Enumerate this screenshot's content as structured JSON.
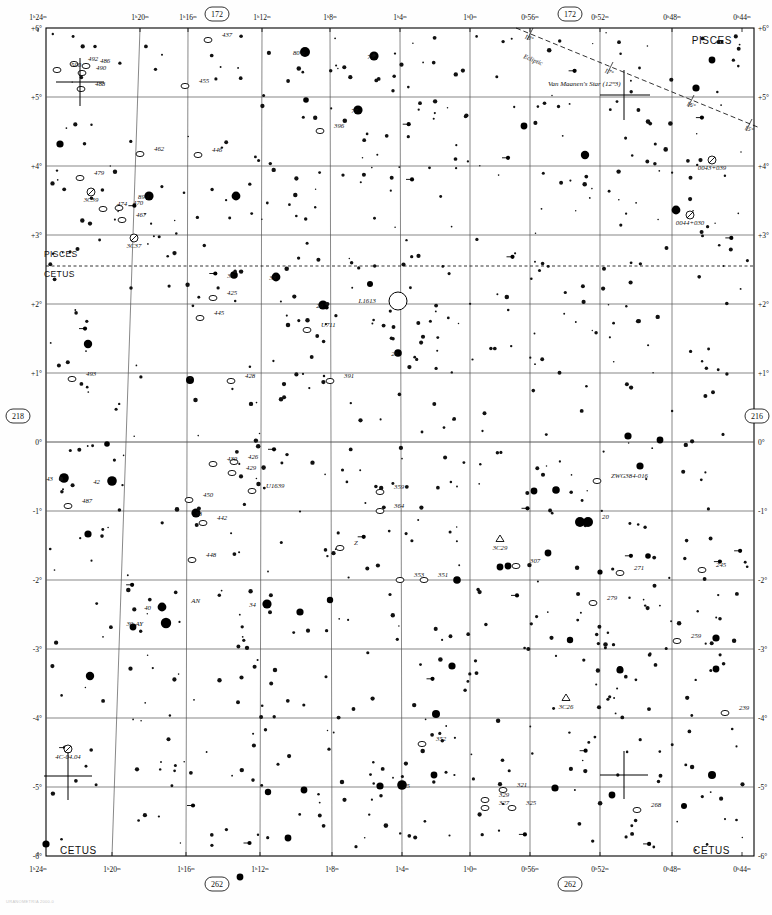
{
  "chart": {
    "number_top": "172",
    "number_top_right": "172",
    "number_bottom": "262",
    "number_bottom_right": "262",
    "number_left": "218",
    "number_right": "216",
    "footer_note": "URANOMETRIA 2000.0"
  },
  "constellations": [
    {
      "name": "PISCES",
      "x": 732,
      "y": 44
    },
    {
      "name": "PISCES",
      "x": 44,
      "y": 257
    },
    {
      "name": "CETUS",
      "x": 44,
      "y": 277
    },
    {
      "name": "CETUS",
      "x": 60,
      "y": 854
    },
    {
      "name": "CETUS",
      "x": 730,
      "y": 854
    }
  ],
  "ra_ticks_top": [
    {
      "label": "1ʰ24ᵐ",
      "x": 38
    },
    {
      "label": "1ʰ20ᵐ",
      "x": 140
    },
    {
      "label": "1ʰ16ᵐ",
      "x": 188
    },
    {
      "label": "1ʰ12ᵐ",
      "x": 262
    },
    {
      "label": "1ʰ8ᵐ",
      "x": 330
    },
    {
      "label": "1ʰ4ᵐ",
      "x": 400
    },
    {
      "label": "1ʰ0ᵐ",
      "x": 470
    },
    {
      "label": "0ʰ56ᵐ",
      "x": 530
    },
    {
      "label": "0ʰ52ᵐ",
      "x": 600
    },
    {
      "label": "0ʰ48ᵐ",
      "x": 672
    },
    {
      "label": "0ʰ44ᵐ",
      "x": 742
    }
  ],
  "ra_ticks_bottom": [
    {
      "label": "1ʰ24ᵐ",
      "x": 38
    },
    {
      "label": "1ʰ20ᵐ",
      "x": 112
    },
    {
      "label": "1ʰ16ᵐ",
      "x": 186
    },
    {
      "label": "1ʰ12ᵐ",
      "x": 260
    },
    {
      "label": "1ʰ8ᵐ",
      "x": 332
    },
    {
      "label": "1ʰ4ᵐ",
      "x": 402
    },
    {
      "label": "1ʰ0ᵐ",
      "x": 470
    },
    {
      "label": "0ʰ56ᵐ",
      "x": 530
    },
    {
      "label": "0ʰ52ᵐ",
      "x": 600
    },
    {
      "label": "0ʰ48ᵐ",
      "x": 672
    },
    {
      "label": "0ʰ44ᵐ",
      "x": 742
    }
  ],
  "dec_ticks": [
    {
      "label": "+6°",
      "y": 28
    },
    {
      "label": "+5°",
      "y": 97
    },
    {
      "label": "+4°",
      "y": 166
    },
    {
      "label": "+3°",
      "y": 235
    },
    {
      "label": "+2°",
      "y": 304
    },
    {
      "label": "+1°",
      "y": 373
    },
    {
      "label": "0°",
      "y": 442
    },
    {
      "label": "-1°",
      "y": 511
    },
    {
      "label": "-2°",
      "y": 580
    },
    {
      "label": "-3°",
      "y": 649
    },
    {
      "label": "-4°",
      "y": 718
    },
    {
      "label": "-5°",
      "y": 787
    },
    {
      "label": "-6°",
      "y": 856
    }
  ],
  "ecliptic": {
    "label": "Ecliptic",
    "tick_labels": [
      "18°",
      "17°",
      "16°",
      "15°"
    ],
    "x1": 516,
    "y1": 28,
    "x2": 762,
    "y2": 128
  },
  "named_stars": [
    {
      "label": "Van Maanen's Star (12ᵐ3)",
      "x": 624,
      "y": 88
    }
  ],
  "deep_sky": [
    {
      "label": "437",
      "type": "galaxy",
      "x": 208,
      "y": 40
    },
    {
      "label": "455",
      "type": "galaxy",
      "x": 185,
      "y": 86
    },
    {
      "label": "500",
      "type": "galaxy",
      "x": 57,
      "y": 70
    },
    {
      "label": "492",
      "type": "galaxy",
      "x": 74,
      "y": 64
    },
    {
      "label": "486",
      "type": "galaxy",
      "x": 86,
      "y": 66
    },
    {
      "label": "490",
      "type": "galaxy",
      "x": 82,
      "y": 73
    },
    {
      "label": "488",
      "type": "galaxy",
      "x": 81,
      "y": 89
    },
    {
      "label": "462",
      "type": "galaxy",
      "x": 140,
      "y": 154
    },
    {
      "label": "446",
      "type": "galaxy",
      "x": 198,
      "y": 155
    },
    {
      "label": "396",
      "type": "galaxy",
      "x": 320,
      "y": 131
    },
    {
      "label": "479",
      "type": "galaxy",
      "x": 80,
      "y": 178
    },
    {
      "label": "3C39",
      "type": "quasar",
      "x": 91,
      "y": 192
    },
    {
      "label": "474",
      "type": "galaxy",
      "x": 103,
      "y": 209
    },
    {
      "label": "470",
      "type": "galaxy",
      "x": 119,
      "y": 208
    },
    {
      "label": "467",
      "type": "galaxy",
      "x": 122,
      "y": 220
    },
    {
      "label": "3C37",
      "type": "quasar",
      "x": 134,
      "y": 238
    },
    {
      "label": "425",
      "type": "galaxy",
      "x": 213,
      "y": 298
    },
    {
      "label": "445",
      "type": "galaxy",
      "x": 200,
      "y": 318
    },
    {
      "label": "U711",
      "type": "galaxy",
      "x": 307,
      "y": 330
    },
    {
      "label": "I.1613",
      "type": "galaxy",
      "x": 376,
      "y": 300
    },
    {
      "label": "493",
      "type": "galaxy",
      "x": 72,
      "y": 379
    },
    {
      "label": "428",
      "type": "galaxy",
      "x": 231,
      "y": 381
    },
    {
      "label": "391",
      "type": "galaxy",
      "x": 330,
      "y": 381
    },
    {
      "label": "430",
      "type": "galaxy",
      "x": 213,
      "y": 464
    },
    {
      "label": "426",
      "type": "galaxy",
      "x": 234,
      "y": 462
    },
    {
      "label": "429",
      "type": "galaxy",
      "x": 232,
      "y": 473
    },
    {
      "label": "U1639",
      "type": "galaxy",
      "x": 252,
      "y": 491
    },
    {
      "label": "450",
      "type": "galaxy",
      "x": 189,
      "y": 500
    },
    {
      "label": "442",
      "type": "galaxy",
      "x": 203,
      "y": 523
    },
    {
      "label": "487",
      "type": "galaxy",
      "x": 68,
      "y": 506
    },
    {
      "label": "448",
      "type": "galaxy",
      "x": 192,
      "y": 560
    },
    {
      "label": "359",
      "type": "galaxy",
      "x": 380,
      "y": 492
    },
    {
      "label": "364",
      "type": "galaxy",
      "x": 380,
      "y": 511
    },
    {
      "label": "Z",
      "type": "galaxy",
      "x": 340,
      "y": 548
    },
    {
      "label": "353",
      "type": "galaxy",
      "x": 400,
      "y": 580
    },
    {
      "label": "351",
      "type": "galaxy",
      "x": 424,
      "y": 580
    },
    {
      "label": "3C29",
      "type": "radio",
      "x": 500,
      "y": 539
    },
    {
      "label": "307",
      "type": "galaxy",
      "x": 516,
      "y": 566
    },
    {
      "label": "ZWG384-016",
      "type": "galaxy",
      "x": 597,
      "y": 481
    },
    {
      "label": "20",
      "type": "star",
      "x": 588,
      "y": 522
    },
    {
      "label": "271",
      "type": "galaxy",
      "x": 620,
      "y": 573
    },
    {
      "label": "279",
      "type": "galaxy",
      "x": 593,
      "y": 603
    },
    {
      "label": "245",
      "type": "galaxy",
      "x": 702,
      "y": 570
    },
    {
      "label": "259",
      "type": "galaxy",
      "x": 677,
      "y": 641
    },
    {
      "label": "3C26",
      "type": "radio",
      "x": 566,
      "y": 698
    },
    {
      "label": "239",
      "type": "galaxy",
      "x": 725,
      "y": 713
    },
    {
      "label": "352",
      "type": "galaxy",
      "x": 422,
      "y": 744
    },
    {
      "label": "321",
      "type": "galaxy",
      "x": 503,
      "y": 790
    },
    {
      "label": "329",
      "type": "galaxy",
      "x": 485,
      "y": 800
    },
    {
      "label": "327",
      "type": "galaxy",
      "x": 485,
      "y": 808
    },
    {
      "label": "325",
      "type": "galaxy",
      "x": 512,
      "y": 808
    },
    {
      "label": "268",
      "type": "galaxy",
      "x": 637,
      "y": 810
    },
    {
      "label": "4C-04.04",
      "type": "quasar",
      "x": 68,
      "y": 749
    },
    {
      "label": "0043+039",
      "type": "quasar",
      "x": 712,
      "y": 160
    },
    {
      "label": "0044+030",
      "type": "quasar",
      "x": 690,
      "y": 215
    }
  ],
  "flamsteed_stars": [
    {
      "label": "80-e",
      "x": 305,
      "y": 52
    },
    {
      "label": "73",
      "x": 374,
      "y": 56
    },
    {
      "label": "77",
      "x": 358,
      "y": 110
    },
    {
      "label": "89-f",
      "x": 149,
      "y": 196
    },
    {
      "label": "35",
      "x": 234,
      "y": 275
    },
    {
      "label": "33",
      "x": 276,
      "y": 277
    },
    {
      "label": "29",
      "x": 323,
      "y": 305
    },
    {
      "label": "26",
      "x": 398,
      "y": 353
    },
    {
      "label": "43",
      "x": 53,
      "y": 478
    },
    {
      "label": "42",
      "x": 100,
      "y": 481
    },
    {
      "label": "38",
      "x": 202,
      "y": 513
    },
    {
      "label": "40",
      "x": 151,
      "y": 607
    },
    {
      "label": "39-AY",
      "x": 143,
      "y": 623
    },
    {
      "label": "AN",
      "x": 200,
      "y": 600
    },
    {
      "label": "34",
      "x": 256,
      "y": 604
    },
    {
      "label": "25",
      "x": 410,
      "y": 785
    }
  ]
}
